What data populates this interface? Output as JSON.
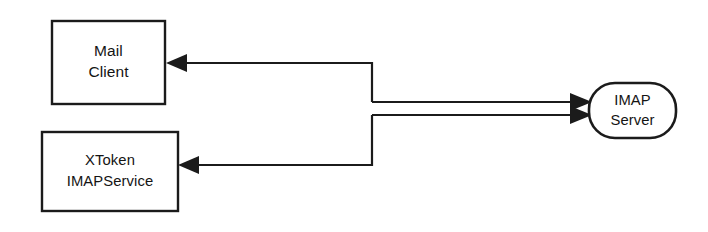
{
  "diagram": {
    "background_color": "#ffffff",
    "stroke_color": "#1b1b1b",
    "text_color": "#141414",
    "nodes": [
      {
        "id": "mail-client",
        "shape": "rectangle",
        "label_line1": "Mail",
        "label_line2": "Client",
        "x": 52,
        "y": 21,
        "width": 113,
        "height": 83
      },
      {
        "id": "xtoken-imapservice",
        "shape": "rectangle",
        "label_line1": "XToken",
        "label_line2": "IMAPService",
        "x": 42,
        "y": 132,
        "width": 136,
        "height": 79
      },
      {
        "id": "imap-server",
        "shape": "rounded-stadium",
        "label_line1": "IMAP",
        "label_line2": "Server",
        "x": 589,
        "y": 83,
        "width": 87,
        "height": 55
      }
    ],
    "connectors": [
      {
        "id": "server-to-mail-client",
        "from": "imap-server",
        "to": "mail-client",
        "direction": "leftward",
        "path": "M 372 102 L 372 63 L 178 63",
        "arrow_at": "mail-client-right-edge"
      },
      {
        "id": "server-to-xtoken",
        "from": "imap-server",
        "to": "xtoken-imapservice",
        "direction": "leftward",
        "path": "M 372 115 L 372 165 L 190 165",
        "arrow_at": "xtoken-right-edge"
      },
      {
        "id": "mail-client-to-server",
        "from": "mail-client",
        "to": "imap-server",
        "direction": "rightward",
        "path": "M 372 102 L 580 102",
        "arrow_at": "imap-server-left-edge"
      },
      {
        "id": "xtoken-to-server",
        "from": "xtoken-imapservice",
        "to": "imap-server",
        "direction": "rightward",
        "path": "M 372 115 L 580 115",
        "arrow_at": "imap-server-left-edge"
      }
    ]
  }
}
